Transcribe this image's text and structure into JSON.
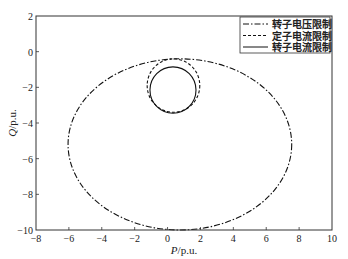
{
  "chart_data": {
    "type": "line",
    "title": "",
    "xlabel": "P/p.u.",
    "ylabel": "Q/p.u.",
    "xlim": [
      -8,
      10
    ],
    "ylim": [
      -10,
      2
    ],
    "xticks": [
      -8,
      -6,
      -4,
      -2,
      0,
      2,
      4,
      6,
      8,
      10
    ],
    "yticks": [
      2,
      0,
      -2,
      -4,
      -6,
      -8,
      -10
    ],
    "grid": false,
    "legend_position": "upper right",
    "series": [
      {
        "name": "转子电压限制",
        "style": "dash-dot",
        "shape": "ellipse",
        "center": [
          0.75,
          -5.2
        ],
        "radii": [
          6.8,
          4.8
        ]
      },
      {
        "name": "定子电流限制",
        "style": "dashed",
        "shape": "circle",
        "center": [
          0.36,
          -1.9
        ],
        "radii": [
          1.6,
          1.5
        ]
      },
      {
        "name": "转子电流限制",
        "style": "solid",
        "shape": "circle",
        "center": [
          0.33,
          -2.15
        ],
        "radii": [
          1.4,
          1.3
        ]
      }
    ]
  },
  "legend": {
    "items": [
      {
        "label": "转子电压限制",
        "dash": "6,2,1.5,2"
      },
      {
        "label": "定子电流限制",
        "dash": "3,2"
      },
      {
        "label": "转子电流限制",
        "dash": ""
      }
    ]
  },
  "axes": {
    "xlabel_main": "P",
    "xlabel_unit": "/p.u.",
    "ylabel_main": "Q",
    "ylabel_unit": "/p.u."
  }
}
